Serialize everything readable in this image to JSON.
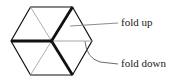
{
  "figure": {
    "type": "diagram",
    "background_color": "#ffffff",
    "shape": {
      "name": "hexagon",
      "stroke_color": "#111111",
      "thin_stroke_color": "#9a9a9a",
      "outline_width": 1.2,
      "thick_width": 2.6,
      "thin_width": 0.8,
      "vertices": [
        {
          "id": "top-left",
          "x": 30.5,
          "y": 7.0
        },
        {
          "id": "top-right",
          "x": 72.5,
          "y": 7.0
        },
        {
          "id": "right",
          "x": 92.0,
          "y": 41.0
        },
        {
          "id": "bottom-right",
          "x": 72.5,
          "y": 75.0
        },
        {
          "id": "bottom-left",
          "x": 30.5,
          "y": 75.0
        },
        {
          "id": "left",
          "x": 11.0,
          "y": 41.0
        }
      ],
      "center": {
        "x": 51.5,
        "y": 41.0
      },
      "internal_lines": [
        {
          "id": "diameter-horizontal-left",
          "from": "left",
          "to": "center",
          "weight": "thick",
          "fold": "down"
        },
        {
          "id": "diameter-horizontal-right",
          "from": "center",
          "to": "right",
          "weight": "thin",
          "fold": "up"
        },
        {
          "id": "diameter-ne",
          "from": "center",
          "to": "top-right",
          "weight": "thick",
          "fold": "down"
        },
        {
          "id": "diameter-sw",
          "from": "center",
          "to": "bottom-left",
          "weight": "thin",
          "fold": "up"
        },
        {
          "id": "diameter-nw",
          "from": "center",
          "to": "top-left",
          "weight": "thin",
          "fold": "up"
        },
        {
          "id": "diameter-se",
          "from": "center",
          "to": "bottom-right",
          "weight": "thick",
          "fold": "down"
        }
      ]
    },
    "leaders": [
      {
        "id": "leader-fold-up",
        "style": "straight",
        "color": "#8c8c8c",
        "from": {
          "x": 70.0,
          "y": 26.0
        },
        "to": {
          "x": 118.0,
          "y": 23.0
        }
      },
      {
        "id": "leader-fold-down",
        "style": "curved",
        "color": "#6b6b6b",
        "from": {
          "x": 85.0,
          "y": 41.5
        },
        "control": {
          "x": 86.0,
          "y": 58.0
        },
        "to": {
          "x": 118.0,
          "y": 64.0
        }
      }
    ],
    "labels": {
      "fold_up": "fold up",
      "fold_down": "fold down"
    }
  }
}
